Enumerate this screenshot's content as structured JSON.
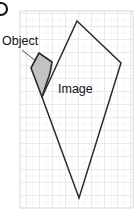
{
  "figure": {
    "width": 138,
    "height": 218,
    "background_color": "#ffffff",
    "corner_marker": {
      "name": "figure-part-label-fragment",
      "description": "partial dark circular glyph cropped at top-left edge",
      "color": "#1a1a1a",
      "cx": 1,
      "cy": 9,
      "r": 6
    },
    "grid": {
      "visible": true,
      "x": 20,
      "y": 11,
      "width": 113,
      "height": 197,
      "major_spacing": 13,
      "minor_spacing": 6.5,
      "major_color": "#dadde3",
      "minor_color": "#eceef2",
      "border_color": "#d5d8de"
    },
    "labels": [
      {
        "id": "object",
        "text": "Object",
        "x": 2,
        "y": 35,
        "font_size": 12.5,
        "color": "#111111"
      },
      {
        "id": "image",
        "text": "Image",
        "x": 58,
        "y": 83,
        "font_size": 12.5,
        "color": "#111111"
      }
    ],
    "leader_line": {
      "name": "object-leader-line",
      "from_x": 22,
      "from_y": 50,
      "to_x": 42,
      "to_y": 66,
      "color": "#3a3a3a",
      "width": 0.9
    },
    "shapes": [
      {
        "id": "object-kite",
        "label": "Object",
        "type": "polygon",
        "fill": "#bfbfbf",
        "fill_opacity": 0.95,
        "stroke": "#2b2b2b",
        "stroke_width": 1.6,
        "points": "39,53 52,62 50,73 42,97 31,68"
      },
      {
        "id": "image-kite",
        "label": "Image",
        "type": "polygon",
        "fill": "none",
        "stroke": "#2b2b2b",
        "stroke_width": 1.5,
        "points": "77,21 121,63 79,198 42,97"
      }
    ]
  }
}
